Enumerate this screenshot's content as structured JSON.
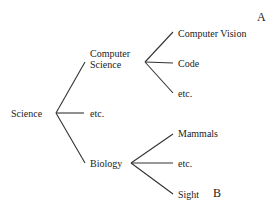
{
  "tree": {
    "root": {
      "label": "Science"
    },
    "level1": [
      {
        "label_line1": "Computer",
        "label_line2": "Science"
      },
      {
        "label": "etc."
      },
      {
        "label": "Biology"
      }
    ],
    "computer_science_children": [
      {
        "label": "Computer Vision"
      },
      {
        "label": "Code"
      },
      {
        "label": "etc."
      }
    ],
    "biology_children": [
      {
        "label": "Mammals"
      },
      {
        "label": "etc."
      },
      {
        "label": "Sight"
      }
    ]
  },
  "markers": {
    "a": "A",
    "b": "B"
  },
  "colors": {
    "line": "#333333",
    "text": "#222222",
    "background": "#ffffff"
  }
}
